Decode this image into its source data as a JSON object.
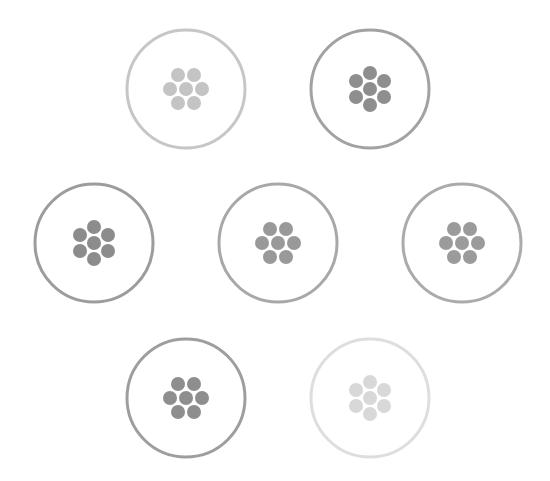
{
  "canvas": {
    "width": 550,
    "height": 481,
    "background": "#ffffff"
  },
  "badges": [
    {
      "id": "badge-1",
      "cx": 186,
      "cy": 89,
      "r": 59,
      "ring_color": "#c6c6c6",
      "dot_color": "#c4c4c4",
      "layout": "flat"
    },
    {
      "id": "badge-2",
      "cx": 370,
      "cy": 89,
      "r": 59,
      "ring_color": "#a2a2a2",
      "dot_color": "#8e8e8e",
      "layout": "pointy"
    },
    {
      "id": "badge-3",
      "cx": 94,
      "cy": 243,
      "r": 59,
      "ring_color": "#9c9c9c",
      "dot_color": "#8c8c8c",
      "layout": "pointy"
    },
    {
      "id": "badge-4",
      "cx": 278,
      "cy": 243,
      "r": 59,
      "ring_color": "#a8a8a8",
      "dot_color": "#999999",
      "layout": "flat"
    },
    {
      "id": "badge-5",
      "cx": 462,
      "cy": 243,
      "r": 59,
      "ring_color": "#ababab",
      "dot_color": "#9b9b9b",
      "layout": "flat"
    },
    {
      "id": "badge-6",
      "cx": 186,
      "cy": 398,
      "r": 59,
      "ring_color": "#9e9e9e",
      "dot_color": "#8e8e8e",
      "layout": "flat"
    },
    {
      "id": "badge-7",
      "cx": 370,
      "cy": 398,
      "r": 59,
      "ring_color": "#dedede",
      "dot_color": "#d8d8d8",
      "layout": "pointy"
    }
  ],
  "dot": {
    "radius": 7,
    "spacing": 16,
    "row_spacing": 14
  }
}
